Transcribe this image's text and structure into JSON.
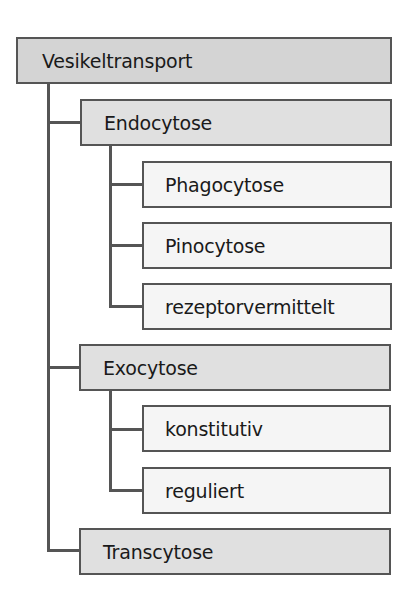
{
  "diagram": {
    "type": "tree",
    "root": {
      "label": "Vesikeltransport",
      "children": [
        {
          "label": "Endocytose",
          "children": [
            {
              "label": "Phagocytose"
            },
            {
              "label": "Pinocytose"
            },
            {
              "label": "rezeptorvermittelt"
            }
          ]
        },
        {
          "label": "Exocytose",
          "children": [
            {
              "label": "konstitutiv"
            },
            {
              "label": "reguliert"
            }
          ]
        },
        {
          "label": "Transcytose"
        }
      ]
    },
    "colors": {
      "border": "#555555",
      "root_fill": "#d4d4d4",
      "level1_fill": "#e0e0e0",
      "level2_fill": "#f5f5f5",
      "text": "#1a1a1a"
    }
  }
}
